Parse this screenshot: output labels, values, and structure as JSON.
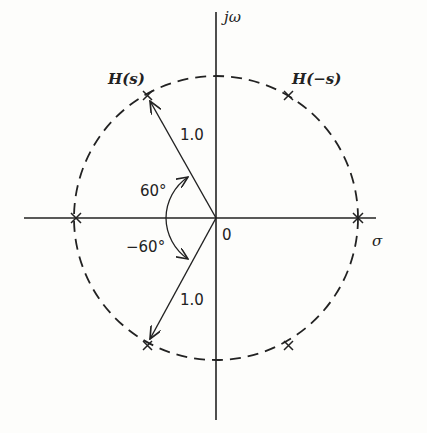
{
  "diagram": {
    "axes": {
      "vertical_label": "jω",
      "horizontal_label": "σ",
      "origin_label": "0"
    },
    "labels": {
      "left_half": "H(s)",
      "right_half": "H(−s)"
    },
    "radius_labels": [
      "1.0",
      "1.0"
    ],
    "angle_labels": [
      "60°",
      "−60°"
    ],
    "poles": [
      {
        "angle_deg": 180,
        "side": "left"
      },
      {
        "angle_deg": 120,
        "side": "left"
      },
      {
        "angle_deg": 240,
        "side": "left"
      },
      {
        "angle_deg": 0,
        "side": "right"
      },
      {
        "angle_deg": 60,
        "side": "right"
      },
      {
        "angle_deg": -60,
        "side": "right"
      }
    ],
    "circle": {
      "radius": 1.0,
      "style": "dashed"
    }
  }
}
